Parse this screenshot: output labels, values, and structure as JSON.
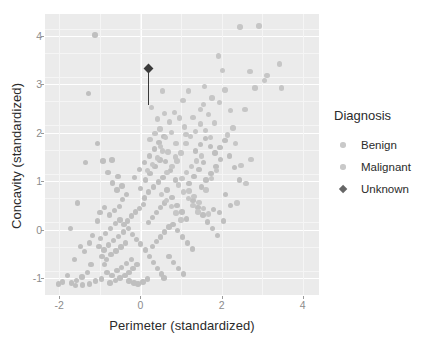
{
  "chart_data": {
    "type": "scatter",
    "title": "",
    "xlabel": "Perimeter (standardized)",
    "ylabel": "Concavity (standardized)",
    "xlim": [
      -2.35,
      4.4
    ],
    "ylim": [
      -1.35,
      4.45
    ],
    "xticks": [
      -2,
      0,
      2,
      4
    ],
    "xticklabels": [
      "-2",
      "0",
      "2",
      "4"
    ],
    "yticks": [
      -1,
      0,
      1,
      2,
      3,
      4
    ],
    "yticklabels": [
      "-1",
      "0",
      "1",
      "2",
      "3",
      "4"
    ],
    "grid": true,
    "legend_position": "right",
    "legend_title": "Diagnosis",
    "series": [
      {
        "name": "Benign",
        "marker": "circle",
        "color": "#bfbfbf",
        "points": [
          [
            -1.12,
            4.02
          ],
          [
            -1.28,
            2.81
          ],
          [
            -1.35,
            1.38
          ],
          [
            -1.55,
            0.55
          ],
          [
            -1.72,
            0.02
          ],
          [
            -1.48,
            -0.35
          ],
          [
            -1.62,
            -0.62
          ],
          [
            -1.8,
            -0.95
          ],
          [
            -1.92,
            -1.08
          ],
          [
            -2.02,
            -1.12
          ],
          [
            -1.7,
            -1.1
          ],
          [
            -1.58,
            -1.05
          ],
          [
            -1.44,
            -0.98
          ],
          [
            -1.3,
            -0.88
          ],
          [
            -1.22,
            -0.72
          ],
          [
            -1.38,
            -0.45
          ],
          [
            -1.25,
            -0.28
          ],
          [
            -1.18,
            -0.12
          ],
          [
            -1.05,
            0.18
          ],
          [
            -1.02,
            -0.35
          ],
          [
            -0.95,
            -0.55
          ],
          [
            -0.88,
            -0.72
          ],
          [
            -0.82,
            -0.88
          ],
          [
            -0.96,
            -1.02
          ],
          [
            -1.1,
            -1.06
          ],
          [
            -1.25,
            -1.12
          ],
          [
            -1.42,
            -1.14
          ],
          [
            -1.6,
            -1.15
          ],
          [
            -0.75,
            -1.1
          ],
          [
            -0.62,
            -1.05
          ],
          [
            -0.5,
            -1.0
          ],
          [
            -0.38,
            -0.95
          ],
          [
            -0.28,
            -0.88
          ],
          [
            -0.18,
            -0.8
          ],
          [
            -0.08,
            -0.72
          ],
          [
            -0.7,
            -0.95
          ],
          [
            -0.58,
            -0.85
          ],
          [
            -0.46,
            -0.78
          ],
          [
            -0.34,
            -0.7
          ],
          [
            -0.22,
            -0.62
          ],
          [
            -0.84,
            -0.62
          ],
          [
            -0.72,
            -0.52
          ],
          [
            -0.6,
            -0.44
          ],
          [
            -0.48,
            -0.36
          ],
          [
            -0.36,
            -0.28
          ],
          [
            -0.9,
            -0.42
          ],
          [
            -0.78,
            -0.32
          ],
          [
            -0.66,
            -0.22
          ],
          [
            -0.54,
            -0.14
          ],
          [
            -0.42,
            -0.05
          ],
          [
            -0.98,
            -0.18
          ],
          [
            -0.86,
            -0.08
          ],
          [
            -0.74,
            0.02
          ],
          [
            -0.62,
            0.12
          ],
          [
            -0.5,
            0.2
          ],
          [
            -1.0,
            0.35
          ],
          [
            -0.88,
            0.45
          ],
          [
            -0.76,
            0.3
          ],
          [
            -0.64,
            0.4
          ],
          [
            -0.52,
            0.48
          ],
          [
            -0.4,
            0.1
          ],
          [
            -0.3,
            0.02
          ],
          [
            -0.2,
            -0.1
          ],
          [
            -0.1,
            -0.2
          ],
          [
            0.0,
            -0.3
          ],
          [
            -0.32,
            0.18
          ],
          [
            -0.22,
            0.28
          ],
          [
            -0.12,
            0.36
          ],
          [
            -0.02,
            0.44
          ],
          [
            0.08,
            0.52
          ],
          [
            -0.44,
            0.62
          ],
          [
            -0.34,
            0.72
          ],
          [
            -0.58,
            0.82
          ],
          [
            -0.68,
            0.96
          ],
          [
            -0.8,
            1.18
          ],
          [
            -0.92,
            1.42
          ],
          [
            -1.05,
            1.78
          ],
          [
            -0.7,
            1.44
          ],
          [
            -0.55,
            1.1
          ],
          [
            -0.45,
            0.9
          ],
          [
            0.12,
            -0.42
          ],
          [
            0.22,
            -0.55
          ],
          [
            0.32,
            -0.68
          ],
          [
            0.42,
            -0.8
          ],
          [
            0.52,
            -0.92
          ],
          [
            0.18,
            -1.02
          ],
          [
            0.06,
            -1.08
          ],
          [
            -0.06,
            -1.12
          ],
          [
            -0.16,
            -1.1
          ],
          [
            -0.28,
            -1.06
          ],
          [
            0.3,
            -0.35
          ],
          [
            0.4,
            -0.25
          ],
          [
            0.5,
            -0.15
          ],
          [
            0.6,
            -0.05
          ],
          [
            0.7,
            0.05
          ],
          [
            0.2,
            0.15
          ],
          [
            0.3,
            0.25
          ],
          [
            0.4,
            0.35
          ],
          [
            0.5,
            0.45
          ],
          [
            0.6,
            0.55
          ],
          [
            0.1,
            0.65
          ],
          [
            0.2,
            0.78
          ],
          [
            0.32,
            0.88
          ],
          [
            0.44,
            0.98
          ],
          [
            0.56,
            1.08
          ],
          [
            0.0,
            0.85
          ],
          [
            0.12,
            1.02
          ],
          [
            0.24,
            1.16
          ],
          [
            0.36,
            1.3
          ],
          [
            0.48,
            1.44
          ],
          [
            -0.14,
            1.08
          ],
          [
            -0.02,
            1.24
          ],
          [
            0.1,
            1.38
          ],
          [
            0.22,
            1.52
          ],
          [
            0.34,
            1.66
          ],
          [
            0.46,
            1.8
          ],
          [
            0.58,
            1.92
          ],
          [
            0.62,
            1.4
          ],
          [
            0.74,
            1.22
          ],
          [
            0.86,
            1.02
          ],
          [
            0.66,
            0.82
          ],
          [
            0.78,
            0.66
          ],
          [
            0.9,
            0.5
          ],
          [
            1.02,
            0.36
          ],
          [
            1.14,
            0.22
          ],
          [
            0.8,
            0.1
          ],
          [
            0.92,
            -0.02
          ],
          [
            1.04,
            -0.15
          ],
          [
            1.16,
            -0.28
          ],
          [
            1.28,
            -0.4
          ],
          [
            0.7,
            -0.55
          ],
          [
            0.82,
            -0.68
          ],
          [
            0.94,
            -0.8
          ],
          [
            1.06,
            -0.92
          ],
          [
            0.58,
            -1.0
          ],
          [
            1.2,
            0.95
          ],
          [
            1.32,
            1.1
          ],
          [
            1.44,
            1.24
          ],
          [
            1.56,
            1.38
          ],
          [
            1.3,
            0.6
          ],
          [
            1.42,
            0.45
          ],
          [
            1.54,
            0.3
          ],
          [
            1.66,
            0.16
          ],
          [
            1.78,
            0.02
          ],
          [
            1.9,
            -0.12
          ],
          [
            1.5,
            0.88
          ],
          [
            1.62,
            1.02
          ],
          [
            1.74,
            1.16
          ],
          [
            1.86,
            1.3
          ],
          [
            1.98,
            1.45
          ],
          [
            1.35,
            1.62
          ],
          [
            1.48,
            1.76
          ],
          [
            1.6,
            1.88
          ],
          [
            1.72,
            1.72
          ],
          [
            1.84,
            1.58
          ],
          [
            1.96,
            1.7
          ],
          [
            2.08,
            1.84
          ],
          [
            2.2,
            1.52
          ],
          [
            2.32,
            1.28
          ],
          [
            2.44,
            1.02
          ],
          [
            2.1,
            0.72
          ],
          [
            2.22,
            0.5
          ],
          [
            1.95,
            0.35
          ],
          [
            2.05,
            0.18
          ],
          [
            1.8,
            0.42
          ]
        ]
      },
      {
        "name": "Malignant",
        "marker": "circle",
        "color": "#c6c6c6",
        "points": [
          [
            0.28,
            2.52
          ],
          [
            0.42,
            2.28
          ],
          [
            0.55,
            2.86
          ],
          [
            0.48,
            2.08
          ],
          [
            0.62,
            1.9
          ],
          [
            0.76,
            2.0
          ],
          [
            0.88,
            1.78
          ],
          [
            1.0,
            1.58
          ],
          [
            1.12,
            1.78
          ],
          [
            1.24,
            1.92
          ],
          [
            1.36,
            2.02
          ],
          [
            1.48,
            2.18
          ],
          [
            1.6,
            2.04
          ],
          [
            1.72,
            1.9
          ],
          [
            1.58,
            2.96
          ],
          [
            1.05,
            2.66
          ],
          [
            1.18,
            2.86
          ],
          [
            1.55,
            2.58
          ],
          [
            1.68,
            2.38
          ],
          [
            1.82,
            2.2
          ],
          [
            1.95,
            2.62
          ],
          [
            2.08,
            2.88
          ],
          [
            2.02,
            3.28
          ],
          [
            1.92,
            3.58
          ],
          [
            2.45,
            4.18
          ],
          [
            2.92,
            4.2
          ],
          [
            2.58,
            2.48
          ],
          [
            2.7,
            3.26
          ],
          [
            2.82,
            2.92
          ],
          [
            3.05,
            3.08
          ],
          [
            3.12,
            3.18
          ],
          [
            3.48,
            2.92
          ],
          [
            3.42,
            3.42
          ],
          [
            2.35,
            1.78
          ],
          [
            2.48,
            1.32
          ],
          [
            2.6,
            0.95
          ],
          [
            2.72,
            1.45
          ],
          [
            2.28,
            2.1
          ],
          [
            2.15,
            1.95
          ],
          [
            2.38,
            0.55
          ],
          [
            1.88,
            1.22
          ],
          [
            1.75,
            1.05
          ],
          [
            1.62,
            0.82
          ],
          [
            1.5,
            1.52
          ],
          [
            1.38,
            1.42
          ],
          [
            1.26,
            1.3
          ],
          [
            1.14,
            1.18
          ],
          [
            1.02,
            1.06
          ],
          [
            0.9,
            1.42
          ],
          [
            0.78,
            1.3
          ],
          [
            0.66,
            1.18
          ],
          [
            0.54,
            1.62
          ],
          [
            0.42,
            1.48
          ],
          [
            0.3,
            1.34
          ],
          [
            0.18,
            1.22
          ],
          [
            0.6,
            2.4
          ],
          [
            0.72,
            2.22
          ],
          [
            0.84,
            2.42
          ],
          [
            0.96,
            2.3
          ],
          [
            1.08,
            2.12
          ],
          [
            0.36,
            1.98
          ],
          [
            0.24,
            1.86
          ],
          [
            0.5,
            1.72
          ],
          [
            0.68,
            1.6
          ],
          [
            0.86,
            1.5
          ],
          [
            1.2,
            0.8
          ],
          [
            1.32,
            0.68
          ],
          [
            1.44,
            0.56
          ],
          [
            1.56,
            0.44
          ],
          [
            1.68,
            0.32
          ],
          [
            0.94,
            0.92
          ],
          [
            1.06,
            0.78
          ],
          [
            1.18,
            0.64
          ],
          [
            1.3,
            0.5
          ],
          [
            1.42,
            0.36
          ],
          [
            0.52,
            0.72
          ],
          [
            0.64,
            0.6
          ],
          [
            0.76,
            0.48
          ],
          [
            0.88,
            0.34
          ],
          [
            1.0,
            0.2
          ],
          [
            1.48,
            2.48
          ],
          [
            1.3,
            2.32
          ],
          [
            1.12,
            1.96
          ],
          [
            2.22,
            2.46
          ],
          [
            1.76,
            2.72
          ]
        ]
      },
      {
        "name": "Unknown",
        "marker": "diamond",
        "color": "#3a3a3a",
        "points": [
          [
            0.2,
            3.32
          ]
        ],
        "segment": {
          "x": 0.2,
          "y_start": 3.32,
          "y_end": 2.58
        }
      }
    ]
  },
  "axes": {
    "x_title": "Perimeter (standardized)",
    "y_title": "Concavity (standardized)",
    "x_tick_labels": [
      "-2",
      "0",
      "2",
      "4"
    ],
    "y_tick_labels": [
      "4",
      "3",
      "2",
      "1",
      "0",
      "-1"
    ]
  },
  "legend": {
    "title": "Diagnosis",
    "items": [
      {
        "label": "Benign",
        "marker": "circle",
        "color": "#c9c9c9"
      },
      {
        "label": "Malignant",
        "marker": "circle",
        "color": "#c9c9c9"
      },
      {
        "label": "Unknown",
        "marker": "diamond",
        "color": "#666666"
      }
    ]
  },
  "theme": {
    "panel_background": "#ebebeb",
    "grid_color": "#ffffff",
    "page_background": "#ffffff",
    "text_color": "#2b2b2b",
    "tick_color": "#8c8c8c"
  }
}
